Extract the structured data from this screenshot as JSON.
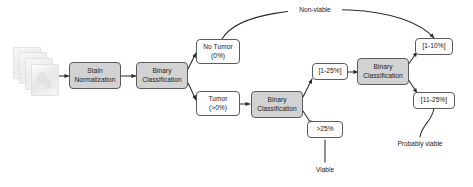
{
  "diagram": {
    "input": {
      "icon": "slide-stack-icon",
      "label": ""
    },
    "nodes": [
      {
        "id": "stain_norm",
        "kind": "process",
        "lines": [
          "Stain",
          "Normalization"
        ]
      },
      {
        "id": "binary_1",
        "kind": "process",
        "lines": [
          "Binary",
          "Classification"
        ]
      },
      {
        "id": "no_tumor",
        "kind": "label",
        "lines": [
          "No Tumor",
          "(0%)"
        ]
      },
      {
        "id": "tumor",
        "kind": "label",
        "lines": [
          "Tumor",
          "(>0%)"
        ]
      },
      {
        "id": "binary_2",
        "kind": "process",
        "lines": [
          "Binary",
          "Classification"
        ]
      },
      {
        "id": "range_1_25",
        "kind": "label",
        "lines": [
          "[1-25%]"
        ]
      },
      {
        "id": "over_25",
        "kind": "label",
        "lines": [
          ">25%"
        ]
      },
      {
        "id": "binary_3",
        "kind": "process",
        "lines": [
          "Binary",
          "Classification"
        ]
      },
      {
        "id": "range_1_10",
        "kind": "label",
        "lines": [
          "[1-10%]"
        ]
      },
      {
        "id": "range_11_25",
        "kind": "label",
        "lines": [
          "[11-25%]"
        ]
      }
    ],
    "outcomes": [
      {
        "id": "non_viable",
        "lines": [
          "Non-viable"
        ]
      },
      {
        "id": "viable",
        "lines": [
          "Viable"
        ]
      },
      {
        "id": "probably_viable",
        "lines": [
          "Probably",
          "viable"
        ]
      }
    ],
    "colors": {
      "process_fill": "#d2d2d2",
      "label_fill": "#fdfdfd",
      "stroke": "#5b5b5b",
      "edge": "#2b2b2b",
      "text": "#1a1a1a",
      "background": "#ffffff"
    }
  }
}
